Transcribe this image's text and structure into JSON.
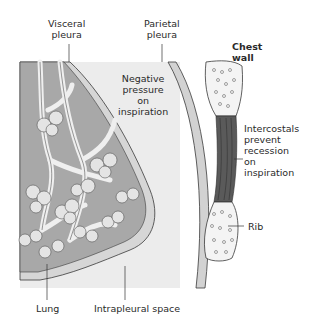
{
  "diagram": {
    "colors": {
      "lung_fill": "#a8a8a8",
      "pleural_space": "#ebebeb",
      "pleura_layer": "#d4d4d4",
      "intercostals": "#5a5a5a",
      "rib_fill": "#f4f4f4",
      "outline": "#3a3a3a"
    },
    "labels": {
      "visceral_pleura": [
        "Visceral",
        "pleura"
      ],
      "parietal_pleura": [
        "Parietal",
        "pleura"
      ],
      "chest_wall": [
        "Chest",
        "wall"
      ],
      "negative_pressure": [
        "Negative",
        "pressure",
        "on",
        "inspiration"
      ],
      "intercostals": [
        "Intercostals",
        "prevent",
        "recession",
        "on",
        "inspiration"
      ],
      "rib": "Rib",
      "lung": "Lung",
      "intrapleural_space": "Intrapleural space"
    }
  }
}
